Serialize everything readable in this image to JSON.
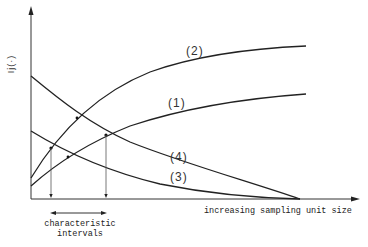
{
  "diagram": {
    "y_axis_label": "Ij(·)",
    "x_axis_label": "increasing sampling unit size",
    "interval_label_line1": "characteristic",
    "interval_label_line2": "intervals",
    "curves": [
      {
        "id": "1",
        "label": "(1)",
        "trend": "increasing"
      },
      {
        "id": "2",
        "label": "(2)",
        "trend": "increasing"
      },
      {
        "id": "3",
        "label": "(3)",
        "trend": "decreasing"
      },
      {
        "id": "4",
        "label": "(4)",
        "trend": "decreasing"
      }
    ],
    "colors": {
      "line": "#222222",
      "background": "#ffffff"
    }
  }
}
